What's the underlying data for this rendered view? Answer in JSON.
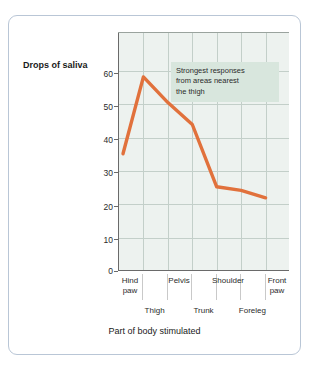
{
  "chart_data": {
    "type": "line",
    "title": "",
    "xlabel": "Part of body stimulated",
    "ylabel": "Drops of saliva",
    "categories": [
      "Hind paw",
      "Thigh",
      "Pelvis",
      "Trunk",
      "Shoulder",
      "Foreleg",
      "Front paw"
    ],
    "values": [
      32,
      53,
      46,
      40,
      23,
      22,
      20
    ],
    "ylim": [
      0,
      65
    ],
    "yticks": [
      0,
      10,
      20,
      30,
      40,
      50,
      60
    ],
    "ytick_labels": [
      "0",
      "10",
      "20",
      "30",
      "40",
      "50",
      "60"
    ],
    "grid": true,
    "legend": "none",
    "series": [
      {
        "name": "Drops of saliva",
        "color": "#e1713c",
        "values": [
          32,
          53,
          46,
          40,
          23,
          22,
          20
        ]
      }
    ],
    "annotations": [
      {
        "name": "strongest-responses-note",
        "text": "Strongest responses from areas nearest the thigh",
        "lines": [
          "Strongest responses",
          "from areas nearest",
          "the thigh"
        ],
        "background": "#d8e6dd"
      }
    ],
    "xtick_labels_upper": [
      "Hind paw",
      "Pelvis",
      "Shoulder",
      "Front paw"
    ],
    "xtick_labels_lower": [
      "Thigh",
      "Trunk",
      "Foreleg"
    ]
  },
  "axes": {
    "y_title": "Drops of saliva",
    "x_title": "Part of body stimulated",
    "y_ticks": [
      "60",
      "50",
      "40",
      "30",
      "20",
      "10",
      "0"
    ]
  },
  "x_upper": [
    {
      "line1": "Hind",
      "line2": "paw"
    },
    {
      "line1": "Pelvis",
      "line2": ""
    },
    {
      "line1": "Shoulder",
      "line2": ""
    },
    {
      "line1": "Front",
      "line2": "paw"
    }
  ],
  "x_lower": [
    {
      "label": "Thigh"
    },
    {
      "label": "Trunk"
    },
    {
      "label": "Foreleg"
    }
  ],
  "annotation": {
    "line1": "Strongest responses",
    "line2": "from areas nearest",
    "line3": "the thigh"
  },
  "colors": {
    "line": "#e1713c",
    "plot_background": "#edf2ef",
    "gridline": "#c3cfc9",
    "frame_border": "#b9c6d6",
    "annotation_background": "#d8e6dd",
    "axis": "#6a6a6a"
  }
}
